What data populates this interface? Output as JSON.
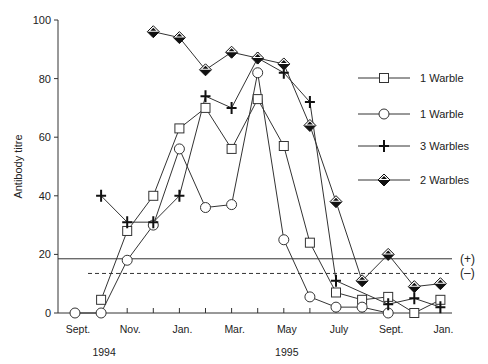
{
  "chart_data": {
    "type": "line",
    "title": "",
    "xlabel": "",
    "ylabel": "Antibody titre",
    "ylim": [
      0,
      100
    ],
    "yticks": [
      0,
      20,
      40,
      60,
      80,
      100
    ],
    "grid": false,
    "legend_position": "right",
    "x_positions_months_from_sept_1994": [
      0,
      1,
      2,
      3,
      4,
      5,
      6,
      7,
      8,
      9,
      10,
      11,
      12,
      13,
      14
    ],
    "x_tick_labels": [
      {
        "pos": 0,
        "label": "Sept."
      },
      {
        "pos": 2,
        "label": "Nov."
      },
      {
        "pos": 4,
        "label": "Jan."
      },
      {
        "pos": 6,
        "label": "Mar."
      },
      {
        "pos": 8,
        "label": "May"
      },
      {
        "pos": 10,
        "label": "July"
      },
      {
        "pos": 12,
        "label": "Sept."
      },
      {
        "pos": 14,
        "label": "Jan."
      }
    ],
    "year_labels": [
      {
        "pos": 1,
        "label": "1994"
      },
      {
        "pos": 8,
        "label": "1995"
      }
    ],
    "reference_lines": [
      {
        "value": 18.5,
        "style": "solid",
        "label": "(+)"
      },
      {
        "value": 13.5,
        "style": "dashed",
        "label": "(–)"
      }
    ],
    "series": [
      {
        "name": "1 Warble",
        "marker": "square",
        "points": [
          [
            1,
            4.5
          ],
          [
            2,
            28
          ],
          [
            3,
            40
          ],
          [
            4,
            63
          ],
          [
            5,
            70
          ],
          [
            6,
            56
          ],
          [
            7,
            73
          ],
          [
            8,
            57
          ],
          [
            9,
            24
          ],
          [
            10,
            7
          ],
          [
            11,
            4.5
          ],
          [
            12,
            5.5
          ],
          [
            13,
            0
          ],
          [
            14,
            4.5
          ]
        ]
      },
      {
        "name": "1 Warble",
        "marker": "circle",
        "points": [
          [
            0,
            0
          ],
          [
            1,
            0
          ],
          [
            2,
            18
          ],
          [
            3,
            30
          ],
          [
            4,
            56
          ],
          [
            5,
            36
          ],
          [
            6,
            37
          ],
          [
            7,
            82
          ],
          [
            8,
            25
          ],
          [
            9,
            5.5
          ],
          [
            10,
            2
          ],
          [
            11,
            2
          ],
          [
            12,
            0
          ]
        ]
      },
      {
        "name": "3 Warbles",
        "marker": "plus",
        "points": [
          [
            1,
            40
          ],
          [
            2,
            31
          ],
          [
            3,
            31
          ],
          [
            4,
            40
          ],
          [
            5,
            74
          ],
          [
            6,
            70
          ],
          [
            7,
            87
          ],
          [
            8,
            82
          ],
          [
            9,
            72
          ],
          [
            10,
            11
          ],
          [
            12,
            3
          ],
          [
            13,
            5
          ],
          [
            14,
            2
          ]
        ]
      },
      {
        "name": "2 Warbles",
        "marker": "diamond",
        "points": [
          [
            3,
            96
          ],
          [
            4,
            94
          ],
          [
            5,
            83
          ],
          [
            6,
            89
          ],
          [
            7,
            87
          ],
          [
            8,
            85
          ],
          [
            9,
            64
          ],
          [
            10,
            38
          ],
          [
            11,
            11
          ],
          [
            12,
            20
          ],
          [
            13,
            9
          ],
          [
            14,
            10
          ]
        ]
      }
    ]
  }
}
